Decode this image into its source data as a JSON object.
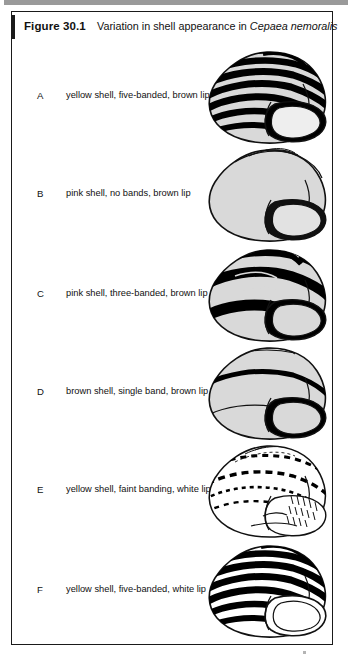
{
  "figure": {
    "label": "Figure 30.1",
    "title_prefix": "Variation in shell appearance in ",
    "species": "Cepaea nemoralis"
  },
  "colors": {
    "ink": "#111111",
    "band": "#000000",
    "shell_body": "#d9d9d9",
    "shell_body_white": "#ffffff",
    "outline": "#1a1a1a",
    "page": "#ffffff",
    "scan_band": "#9a9a9a"
  },
  "rows": [
    {
      "letter": "A",
      "caption": "yellow shell, five-banded, brown lip",
      "shell": {
        "id": "shell-a",
        "body_color": "#d9d9d9",
        "band_count": 5,
        "band_style": "solid-thick",
        "lip": "brown",
        "lip_color": "#000000",
        "banded": true
      }
    },
    {
      "letter": "B",
      "caption": "pink shell, no bands, brown lip",
      "shell": {
        "id": "shell-b",
        "body_color": "#d9d9d9",
        "band_count": 0,
        "band_style": "none",
        "lip": "brown",
        "lip_color": "#000000",
        "banded": false
      }
    },
    {
      "letter": "C",
      "caption": "pink shell, three-banded, brown lip",
      "shell": {
        "id": "shell-c",
        "body_color": "#d9d9d9",
        "band_count": 3,
        "band_style": "solid-very-thick",
        "lip": "brown",
        "lip_color": "#000000",
        "banded": true
      }
    },
    {
      "letter": "D",
      "caption": "brown shell, single band, brown lip",
      "shell": {
        "id": "shell-d",
        "body_color": "#d9d9d9",
        "band_count": 1,
        "band_style": "solid-thick",
        "lip": "brown",
        "lip_color": "#000000",
        "banded": true
      }
    },
    {
      "letter": "E",
      "caption": "yellow shell, faint banding, white lip",
      "shell": {
        "id": "shell-e",
        "body_color": "#ffffff",
        "band_count": 4,
        "band_style": "dashed-faint",
        "lip": "white",
        "lip_color": "#ffffff",
        "banded": true
      }
    },
    {
      "letter": "F",
      "caption": "yellow shell, five-banded, white lip",
      "shell": {
        "id": "shell-f",
        "body_color": "#ffffff",
        "band_count": 5,
        "band_style": "solid-thick",
        "lip": "white",
        "lip_color": "#ffffff",
        "banded": true
      }
    }
  ]
}
